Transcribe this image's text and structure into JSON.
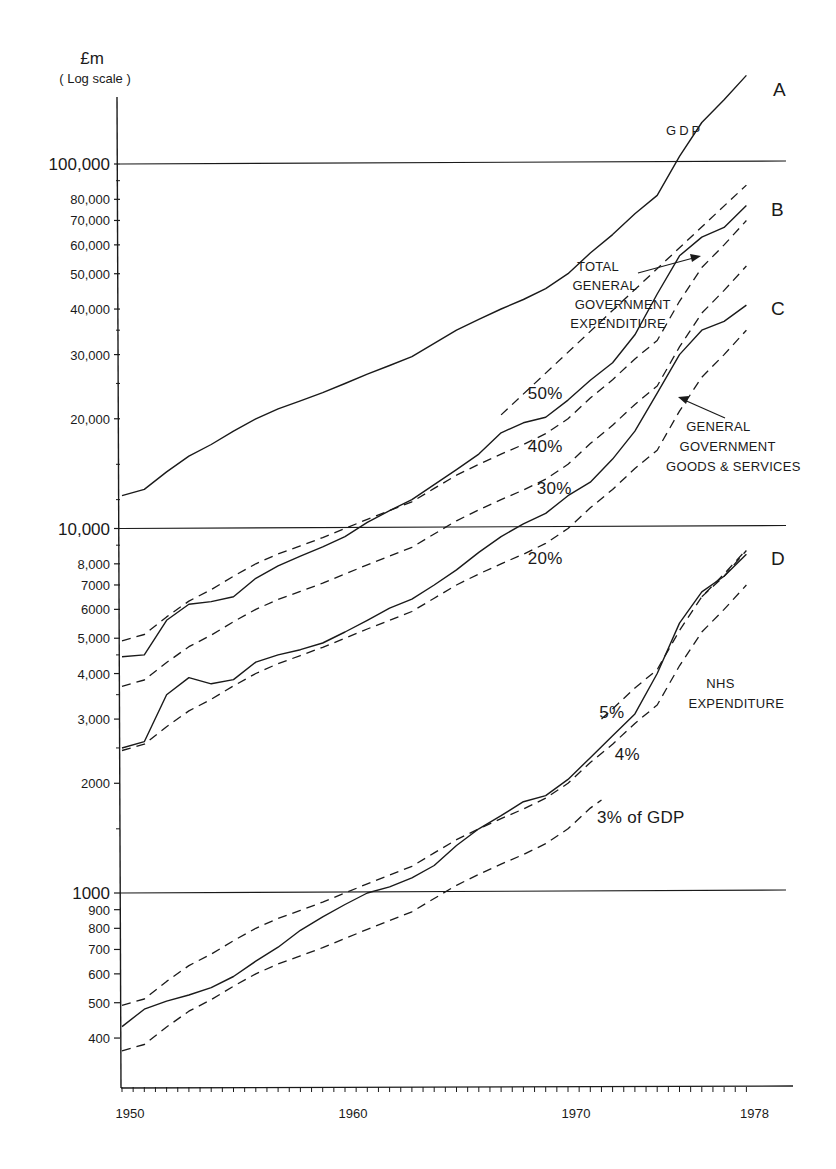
{
  "chart_data": {
    "type": "line",
    "title": "",
    "ylabel": "£m",
    "ylabel_sub": "(Log scale)",
    "xlabel": "",
    "yscale": "log",
    "ylim": [
      250,
      200000
    ],
    "xlim": [
      1950,
      1978.9
    ],
    "grid": "horizontal lines at 1000, 10,000 and 100,000 only",
    "x_ticks": [
      {
        "value": 1950,
        "label": "1950"
      },
      {
        "value": 1960,
        "label": "1960"
      },
      {
        "value": 1970,
        "label": "1970"
      },
      {
        "value": 1978,
        "label": "1978"
      }
    ],
    "y_ticks": [
      {
        "value": 100000,
        "label": "100,000",
        "major": true
      },
      {
        "value": 80000,
        "label": "80,000"
      },
      {
        "value": 70000,
        "label": "70,000"
      },
      {
        "value": 60000,
        "label": "60,000"
      },
      {
        "value": 50000,
        "label": "50,000"
      },
      {
        "value": 40000,
        "label": "40,000"
      },
      {
        "value": 30000,
        "label": "30,000"
      },
      {
        "value": 20000,
        "label": "20,000"
      },
      {
        "value": 10000,
        "label": "10,000",
        "major": true
      },
      {
        "value": 8000,
        "label": "8,000"
      },
      {
        "value": 7000,
        "label": "7000"
      },
      {
        "value": 6000,
        "label": "6000"
      },
      {
        "value": 5000,
        "label": "5,000"
      },
      {
        "value": 4000,
        "label": "4,000"
      },
      {
        "value": 3000,
        "label": "3,000"
      },
      {
        "value": 2000,
        "label": "2000"
      },
      {
        "value": 1000,
        "label": "1000",
        "major": true
      },
      {
        "value": 900,
        "label": "900"
      },
      {
        "value": 800,
        "label": "800"
      },
      {
        "value": 700,
        "label": "700"
      },
      {
        "value": 600,
        "label": "600"
      },
      {
        "value": 500,
        "label": "500"
      },
      {
        "value": 400,
        "label": "400"
      }
    ],
    "series": [
      {
        "name": "GDP",
        "letter": "A",
        "style": "solid",
        "x": [
          1950,
          1951,
          1952,
          1953,
          1954,
          1955,
          1956,
          1957,
          1958,
          1959,
          1960,
          1961,
          1962,
          1963,
          1964,
          1965,
          1966,
          1967,
          1968,
          1969,
          1970,
          1971,
          1972,
          1973,
          1974,
          1975,
          1976,
          1977,
          1978
        ],
        "y": [
          12300,
          12800,
          14300,
          15800,
          17000,
          18500,
          20000,
          21300,
          22400,
          23600,
          25000,
          26500,
          28000,
          29600,
          32200,
          35000,
          37500,
          40000,
          42500,
          45500,
          50000,
          57000,
          64000,
          73000,
          82000,
          105000,
          130000,
          150000,
          175000
        ]
      },
      {
        "name": "Total General Government Expenditure",
        "letter": "B",
        "style": "solid",
        "x": [
          1950,
          1951,
          1952,
          1953,
          1954,
          1955,
          1956,
          1957,
          1958,
          1959,
          1960,
          1961,
          1962,
          1963,
          1964,
          1965,
          1966,
          1967,
          1968,
          1969,
          1970,
          1971,
          1972,
          1973,
          1974,
          1975,
          1976,
          1977,
          1978
        ],
        "y": [
          4450,
          4500,
          5600,
          6200,
          6300,
          6500,
          7300,
          7900,
          8400,
          8900,
          9500,
          10400,
          11200,
          12000,
          13200,
          14500,
          16000,
          18300,
          19500,
          20200,
          22500,
          25500,
          28500,
          34000,
          44000,
          56000,
          63000,
          67000,
          77000
        ]
      },
      {
        "name": "General Government Goods & Services",
        "letter": "C",
        "style": "solid",
        "x": [
          1950,
          1951,
          1952,
          1953,
          1954,
          1955,
          1956,
          1957,
          1958,
          1959,
          1960,
          1961,
          1962,
          1963,
          1964,
          1965,
          1966,
          1967,
          1968,
          1969,
          1970,
          1971,
          1972,
          1973,
          1974,
          1975,
          1976,
          1977,
          1978
        ],
        "y": [
          2500,
          2600,
          3500,
          3900,
          3750,
          3850,
          4300,
          4500,
          4650,
          4850,
          5200,
          5600,
          6050,
          6400,
          7000,
          7700,
          8600,
          9500,
          10300,
          11000,
          12300,
          13400,
          15500,
          18500,
          23500,
          30000,
          35000,
          37000,
          41000
        ]
      },
      {
        "name": "NHS Expenditure",
        "letter": "D",
        "style": "solid",
        "x": [
          1950,
          1951,
          1952,
          1953,
          1954,
          1955,
          1956,
          1957,
          1958,
          1959,
          1960,
          1961,
          1962,
          1963,
          1964,
          1965,
          1966,
          1967,
          1968,
          1969,
          1970,
          1971,
          1972,
          1973,
          1974,
          1975,
          1976,
          1977,
          1978
        ],
        "y": [
          430,
          480,
          505,
          525,
          550,
          590,
          650,
          710,
          790,
          860,
          930,
          1000,
          1040,
          1100,
          1190,
          1350,
          1500,
          1630,
          1780,
          1850,
          2050,
          2350,
          2700,
          3100,
          4000,
          5500,
          6700,
          7400,
          8500
        ]
      },
      {
        "name": "50% of GDP",
        "style": "dashed",
        "x": [
          1967,
          1978
        ],
        "y": [
          20500,
          87500
        ]
      },
      {
        "name": "40% of GDP (vs Total Expenditure)",
        "style": "dashed",
        "x": [
          1950,
          1951,
          1952,
          1953,
          1954,
          1955,
          1956,
          1957,
          1958,
          1959,
          1960,
          1961,
          1962,
          1963,
          1964,
          1965,
          1966,
          1967,
          1968,
          1969,
          1970,
          1971,
          1972,
          1973,
          1974,
          1975,
          1976,
          1977,
          1978
        ],
        "y": [
          4920,
          5120,
          5720,
          6320,
          6800,
          7400,
          8000,
          8520,
          8960,
          9440,
          10000,
          10600,
          11200,
          11840,
          12880,
          14000,
          15000,
          16000,
          17000,
          18200,
          20000,
          22800,
          25600,
          29200,
          32800,
          42000,
          52000,
          60000,
          70000
        ]
      },
      {
        "name": "30% of GDP",
        "style": "dashed",
        "x": [
          1950,
          1951,
          1952,
          1953,
          1954,
          1955,
          1956,
          1957,
          1958,
          1959,
          1960,
          1961,
          1962,
          1963,
          1964,
          1965,
          1966,
          1967,
          1968,
          1969,
          1970,
          1971,
          1972,
          1973,
          1974,
          1975,
          1976,
          1977,
          1978
        ],
        "y": [
          3690,
          3840,
          4290,
          4740,
          5100,
          5550,
          6000,
          6390,
          6720,
          7080,
          7500,
          7950,
          8400,
          8880,
          9660,
          10500,
          11250,
          12000,
          12750,
          13650,
          15000,
          17100,
          19200,
          21900,
          24600,
          31500,
          39000,
          45000,
          52500
        ]
      },
      {
        "name": "20% of GDP",
        "style": "dashed",
        "x": [
          1950,
          1951,
          1952,
          1953,
          1954,
          1955,
          1956,
          1957,
          1958,
          1959,
          1960,
          1961,
          1962,
          1963,
          1964,
          1965,
          1966,
          1967,
          1968,
          1969,
          1970,
          1971,
          1972,
          1973,
          1974,
          1975,
          1976,
          1977,
          1978
        ],
        "y": [
          2460,
          2560,
          2860,
          3160,
          3400,
          3700,
          4000,
          4260,
          4480,
          4720,
          5000,
          5300,
          5600,
          5920,
          6440,
          7000,
          7500,
          8000,
          8500,
          9100,
          10000,
          11400,
          12800,
          14600,
          16400,
          21000,
          26000,
          30000,
          35000
        ]
      },
      {
        "name": "5% of GDP",
        "style": "dashed",
        "x": [
          1971.5,
          1972,
          1973,
          1974,
          1975,
          1976,
          1977,
          1978
        ],
        "y": [
          3000,
          3200,
          3650,
          4100,
          5250,
          6500,
          7500,
          8750
        ]
      },
      {
        "name": "4% of GDP",
        "style": "dashed",
        "x": [
          1950,
          1951,
          1952,
          1953,
          1954,
          1955,
          1956,
          1957,
          1958,
          1959,
          1960,
          1961,
          1962,
          1963,
          1964,
          1965,
          1966,
          1967,
          1968,
          1969,
          1970,
          1971,
          1972,
          1973,
          1974,
          1975,
          1976,
          1977,
          1978
        ],
        "y": [
          492,
          512,
          572,
          632,
          680,
          740,
          800,
          852,
          896,
          944,
          1000,
          1060,
          1120,
          1184,
          1288,
          1400,
          1500,
          1600,
          1700,
          1820,
          2000,
          2280,
          2560,
          2920,
          3280,
          4200,
          5200,
          6000,
          7000
        ]
      },
      {
        "name": "3% of GDP",
        "style": "dashed",
        "x": [
          1950,
          1951,
          1952,
          1953,
          1954,
          1955,
          1956,
          1957,
          1958,
          1959,
          1960,
          1961,
          1962,
          1963,
          1964,
          1965,
          1966,
          1967,
          1968,
          1969,
          1970,
          1971,
          1971.5
        ],
        "y": [
          369,
          384,
          429,
          474,
          510,
          555,
          600,
          639,
          672,
          708,
          750,
          795,
          840,
          888,
          966,
          1050,
          1125,
          1200,
          1275,
          1365,
          1500,
          1710,
          1800
        ]
      },
      {
        "name": "4% of GDP (upper D)",
        "style": "dashed",
        "x": [
          1976,
          1977,
          1978
        ],
        "y": [
          6500,
          7400,
          8700
        ]
      }
    ],
    "annotations": [
      {
        "text": "GDP",
        "x": 1974.4,
        "y": 120000
      },
      {
        "text": "TOTAL",
        "x": 1970.4,
        "y": 51000
      },
      {
        "text": "GENERAL",
        "x": 1970.2,
        "y": 45000
      },
      {
        "text": "GOVERNMENT",
        "x": 1970.3,
        "y": 40000
      },
      {
        "text": "EXPENDITURE",
        "x": 1970.1,
        "y": 35500
      },
      {
        "text": "50%",
        "x": 1968.2,
        "y": 22700
      },
      {
        "text": "40%",
        "x": 1968.2,
        "y": 16200
      },
      {
        "text": "30%",
        "x": 1968.6,
        "y": 12400
      },
      {
        "text": "20%",
        "x": 1968.2,
        "y": 8000
      },
      {
        "text": "GENERAL",
        "x": 1975.3,
        "y": 18500
      },
      {
        "text": "GOVERNMENT",
        "x": 1975.0,
        "y": 16300
      },
      {
        "text": "GOODS & SERVICES",
        "x": 1974.4,
        "y": 14400
      },
      {
        "text": "NHS",
        "x": 1976.2,
        "y": 3650
      },
      {
        "text": "EXPENDITURE",
        "x": 1975.4,
        "y": 3220
      },
      {
        "text": "5%",
        "x": 1971.4,
        "y": 3030
      },
      {
        "text": "4%",
        "x": 1972.1,
        "y": 2320
      },
      {
        "text": "3% of GDP",
        "x": 1971.3,
        "y": 1560
      }
    ]
  },
  "labels": {
    "ylabel": "£m",
    "ylabel_sub": "( Log scale )",
    "series_letters": [
      "A",
      "B",
      "C",
      "D"
    ]
  }
}
